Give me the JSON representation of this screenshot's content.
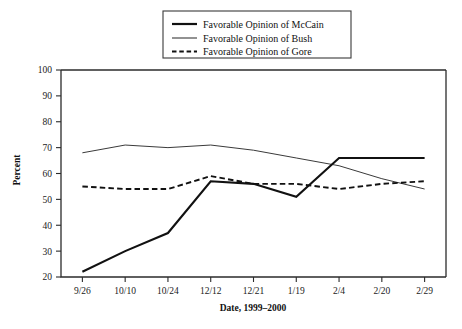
{
  "chart_data": {
    "type": "line",
    "title": "",
    "xlabel": "Date, 1999–2000",
    "ylabel": "Percent",
    "categories": [
      "9/26",
      "10/10",
      "10/24",
      "12/12",
      "12/21",
      "1/19",
      "2/4",
      "2/20",
      "2/29"
    ],
    "ylim": [
      20,
      100
    ],
    "yticks": [
      20,
      30,
      40,
      50,
      60,
      70,
      80,
      90,
      100
    ],
    "grid": false,
    "legend_position": "top-center",
    "series": [
      {
        "name": "Favorable Opinion of McCain",
        "style": "solid-thick",
        "color": "#111111",
        "values": [
          22,
          30,
          37,
          57,
          56,
          51,
          66,
          66,
          66
        ]
      },
      {
        "name": "Favorable Opinion of Bush",
        "style": "solid-thin",
        "color": "#3a3a3a",
        "values": [
          68,
          71,
          70,
          71,
          69,
          66,
          63,
          58,
          54
        ]
      },
      {
        "name": "Favorable Opinion of Gore",
        "style": "dashed",
        "color": "#111111",
        "values": [
          55,
          54,
          54,
          59,
          56,
          56,
          54,
          56,
          57
        ]
      }
    ]
  },
  "legend": {
    "items": [
      {
        "label": "Favorable Opinion of McCain"
      },
      {
        "label": "Favorable Opinion of Bush"
      },
      {
        "label": "Favorable Opinion of Gore"
      }
    ]
  },
  "axes": {
    "y_title": "Percent",
    "x_title": "Date, 1999–2000",
    "y_tick_labels": [
      "100",
      "90",
      "80",
      "70",
      "60",
      "50",
      "40",
      "30",
      "20"
    ],
    "x_tick_labels": [
      "9/26",
      "10/10",
      "10/24",
      "12/12",
      "12/21",
      "1/19",
      "2/4",
      "2/20",
      "2/29"
    ]
  }
}
